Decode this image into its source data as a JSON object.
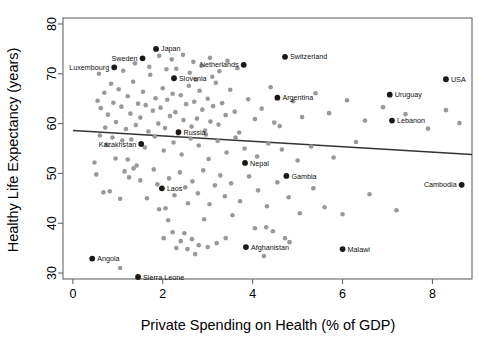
{
  "chart_data": {
    "type": "scatter",
    "title": "",
    "xlabel": "Private Spending on Health (% of GDP)",
    "ylabel": "Healthy Life Expectancy (years)",
    "xlim": [
      -0.22,
      8.88
    ],
    "ylim": [
      28.8,
      81.2
    ],
    "xticks": [
      0,
      2,
      4,
      6,
      8
    ],
    "yticks": [
      30,
      40,
      50,
      60,
      70,
      80
    ],
    "grid": false,
    "legend": null,
    "colors": {
      "highlight_point": "#1a1a1a",
      "other_point": "#999999",
      "trendline": "#333333",
      "axis": "#666666",
      "background": "#ffffff"
    },
    "trendline": {
      "type": "linear",
      "x_start": 0.0,
      "y_start": 58.6,
      "x_end": 8.88,
      "y_end": 53.8
    },
    "labeled_points": [
      {
        "label": "Sweden",
        "x": 1.55,
        "y": 73.1,
        "label_side": "left"
      },
      {
        "label": "Japan",
        "x": 1.85,
        "y": 75.0,
        "label_side": "right"
      },
      {
        "label": "Luxembourg",
        "x": 0.92,
        "y": 71.3,
        "label_side": "left"
      },
      {
        "label": "Slovenia",
        "x": 2.25,
        "y": 69.1,
        "label_side": "right"
      },
      {
        "label": "Netherlands",
        "x": 3.8,
        "y": 71.8,
        "label_side": "left"
      },
      {
        "label": "Switzerland",
        "x": 4.72,
        "y": 73.4,
        "label_side": "right"
      },
      {
        "label": "USA",
        "x": 8.3,
        "y": 68.9,
        "label_side": "right"
      },
      {
        "label": "Uruguay",
        "x": 7.05,
        "y": 65.8,
        "label_side": "right"
      },
      {
        "label": "Argentina",
        "x": 4.55,
        "y": 65.2,
        "label_side": "right"
      },
      {
        "label": "Lebanon",
        "x": 7.1,
        "y": 60.6,
        "label_side": "right"
      },
      {
        "label": "Russia",
        "x": 2.35,
        "y": 58.3,
        "label_side": "right"
      },
      {
        "label": "Kazakhstan",
        "x": 1.52,
        "y": 55.9,
        "label_side": "left"
      },
      {
        "label": "Nepal",
        "x": 3.83,
        "y": 52.1,
        "label_side": "right"
      },
      {
        "label": "Gambia",
        "x": 4.75,
        "y": 49.5,
        "label_side": "right"
      },
      {
        "label": "Cambodia",
        "x": 8.65,
        "y": 47.7,
        "label_side": "left"
      },
      {
        "label": "Laos",
        "x": 1.98,
        "y": 47.0,
        "label_side": "right"
      },
      {
        "label": "Afghanistan",
        "x": 3.85,
        "y": 35.2,
        "label_side": "right"
      },
      {
        "label": "Malawi",
        "x": 6.0,
        "y": 34.8,
        "label_side": "right"
      },
      {
        "label": "Angola",
        "x": 0.43,
        "y": 32.9,
        "label_side": "right"
      },
      {
        "label": "Sierra Leone",
        "x": 1.45,
        "y": 29.2,
        "label_side": "right"
      }
    ],
    "other_points": [
      {
        "x": 0.55,
        "y": 64.6
      },
      {
        "x": 0.62,
        "y": 63.1
      },
      {
        "x": 0.7,
        "y": 66.2
      },
      {
        "x": 0.78,
        "y": 61.8
      },
      {
        "x": 0.85,
        "y": 68.0
      },
      {
        "x": 0.9,
        "y": 64.2
      },
      {
        "x": 0.96,
        "y": 60.3
      },
      {
        "x": 1.02,
        "y": 66.9
      },
      {
        "x": 1.08,
        "y": 63.4
      },
      {
        "x": 1.12,
        "y": 70.6
      },
      {
        "x": 1.18,
        "y": 58.9
      },
      {
        "x": 1.22,
        "y": 65.5
      },
      {
        "x": 1.28,
        "y": 62.0
      },
      {
        "x": 1.34,
        "y": 68.4
      },
      {
        "x": 1.4,
        "y": 59.7
      },
      {
        "x": 1.45,
        "y": 64.0
      },
      {
        "x": 1.5,
        "y": 61.2
      },
      {
        "x": 1.56,
        "y": 66.4
      },
      {
        "x": 1.62,
        "y": 63.7
      },
      {
        "x": 1.68,
        "y": 58.4
      },
      {
        "x": 1.72,
        "y": 69.8
      },
      {
        "x": 1.78,
        "y": 62.6
      },
      {
        "x": 1.84,
        "y": 65.1
      },
      {
        "x": 1.9,
        "y": 60.0
      },
      {
        "x": 1.95,
        "y": 63.2
      },
      {
        "x": 2.0,
        "y": 67.1
      },
      {
        "x": 2.05,
        "y": 59.1
      },
      {
        "x": 2.1,
        "y": 64.8
      },
      {
        "x": 2.16,
        "y": 61.5
      },
      {
        "x": 2.22,
        "y": 66.0
      },
      {
        "x": 2.28,
        "y": 62.3
      },
      {
        "x": 2.34,
        "y": 58.0
      },
      {
        "x": 2.4,
        "y": 65.7
      },
      {
        "x": 2.46,
        "y": 60.7
      },
      {
        "x": 2.52,
        "y": 63.9
      },
      {
        "x": 2.58,
        "y": 67.6
      },
      {
        "x": 2.64,
        "y": 59.4
      },
      {
        "x": 2.7,
        "y": 64.4
      },
      {
        "x": 2.76,
        "y": 61.0
      },
      {
        "x": 2.82,
        "y": 66.6
      },
      {
        "x": 2.88,
        "y": 62.8
      },
      {
        "x": 2.94,
        "y": 58.6
      },
      {
        "x": 3.0,
        "y": 65.0
      },
      {
        "x": 3.06,
        "y": 60.4
      },
      {
        "x": 3.12,
        "y": 63.5
      },
      {
        "x": 3.18,
        "y": 68.2
      },
      {
        "x": 3.24,
        "y": 59.8
      },
      {
        "x": 3.32,
        "y": 64.1
      },
      {
        "x": 3.4,
        "y": 61.7
      },
      {
        "x": 3.5,
        "y": 66.8
      },
      {
        "x": 3.6,
        "y": 62.4
      },
      {
        "x": 3.7,
        "y": 58.2
      },
      {
        "x": 3.9,
        "y": 64.9
      },
      {
        "x": 4.05,
        "y": 60.9
      },
      {
        "x": 4.2,
        "y": 63.0
      },
      {
        "x": 4.4,
        "y": 67.3
      },
      {
        "x": 4.6,
        "y": 59.5
      },
      {
        "x": 4.9,
        "y": 64.5
      },
      {
        "x": 5.1,
        "y": 61.3
      },
      {
        "x": 5.4,
        "y": 66.1
      },
      {
        "x": 5.7,
        "y": 62.1
      },
      {
        "x": 6.1,
        "y": 64.7
      },
      {
        "x": 6.5,
        "y": 60.6
      },
      {
        "x": 6.9,
        "y": 63.3
      },
      {
        "x": 7.4,
        "y": 61.9
      },
      {
        "x": 7.9,
        "y": 59.0
      },
      {
        "x": 8.3,
        "y": 62.7
      },
      {
        "x": 8.6,
        "y": 60.1
      },
      {
        "x": 1.38,
        "y": 72.1
      },
      {
        "x": 1.7,
        "y": 71.4
      },
      {
        "x": 1.92,
        "y": 73.6
      },
      {
        "x": 2.08,
        "y": 70.9
      },
      {
        "x": 2.2,
        "y": 72.9
      },
      {
        "x": 2.3,
        "y": 71.0
      },
      {
        "x": 2.45,
        "y": 73.8
      },
      {
        "x": 2.6,
        "y": 70.2
      },
      {
        "x": 2.68,
        "y": 72.4
      },
      {
        "x": 2.86,
        "y": 71.6
      },
      {
        "x": 3.05,
        "y": 73.2
      },
      {
        "x": 3.26,
        "y": 70.5
      },
      {
        "x": 3.44,
        "y": 72.6
      },
      {
        "x": 3.66,
        "y": 71.1
      },
      {
        "x": 2.74,
        "y": 68.8
      },
      {
        "x": 3.1,
        "y": 69.4
      },
      {
        "x": 1.3,
        "y": 56.8
      },
      {
        "x": 1.6,
        "y": 55.2
      },
      {
        "x": 1.82,
        "y": 57.4
      },
      {
        "x": 2.02,
        "y": 54.6
      },
      {
        "x": 2.24,
        "y": 56.2
      },
      {
        "x": 2.42,
        "y": 53.8
      },
      {
        "x": 2.62,
        "y": 57.0
      },
      {
        "x": 2.8,
        "y": 55.6
      },
      {
        "x": 3.02,
        "y": 52.9
      },
      {
        "x": 3.22,
        "y": 56.5
      },
      {
        "x": 3.42,
        "y": 54.2
      },
      {
        "x": 3.62,
        "y": 57.2
      },
      {
        "x": 3.82,
        "y": 55.0
      },
      {
        "x": 4.1,
        "y": 53.4
      },
      {
        "x": 4.35,
        "y": 56.0
      },
      {
        "x": 4.65,
        "y": 54.8
      },
      {
        "x": 5.0,
        "y": 52.6
      },
      {
        "x": 5.3,
        "y": 55.4
      },
      {
        "x": 5.8,
        "y": 53.2
      },
      {
        "x": 6.3,
        "y": 56.3
      },
      {
        "x": 0.6,
        "y": 57.6
      },
      {
        "x": 0.75,
        "y": 55.8
      },
      {
        "x": 0.95,
        "y": 53.0
      },
      {
        "x": 1.1,
        "y": 56.6
      },
      {
        "x": 0.52,
        "y": 49.8
      },
      {
        "x": 0.68,
        "y": 46.2
      },
      {
        "x": 0.82,
        "y": 46.4
      },
      {
        "x": 1.05,
        "y": 44.9
      },
      {
        "x": 1.15,
        "y": 50.4
      },
      {
        "x": 1.25,
        "y": 49.2
      },
      {
        "x": 1.35,
        "y": 51.0
      },
      {
        "x": 1.5,
        "y": 48.6
      },
      {
        "x": 1.65,
        "y": 45.0
      },
      {
        "x": 1.8,
        "y": 50.8
      },
      {
        "x": 1.88,
        "y": 47.8
      },
      {
        "x": 2.06,
        "y": 43.0
      },
      {
        "x": 2.14,
        "y": 49.0
      },
      {
        "x": 2.26,
        "y": 45.6
      },
      {
        "x": 2.38,
        "y": 50.2
      },
      {
        "x": 2.5,
        "y": 47.2
      },
      {
        "x": 2.56,
        "y": 44.0
      },
      {
        "x": 2.66,
        "y": 48.4
      },
      {
        "x": 2.78,
        "y": 46.0
      },
      {
        "x": 2.9,
        "y": 50.6
      },
      {
        "x": 3.04,
        "y": 43.8
      },
      {
        "x": 3.16,
        "y": 47.6
      },
      {
        "x": 3.28,
        "y": 49.6
      },
      {
        "x": 3.38,
        "y": 45.4
      },
      {
        "x": 3.52,
        "y": 48.0
      },
      {
        "x": 3.72,
        "y": 44.4
      },
      {
        "x": 3.92,
        "y": 49.4
      },
      {
        "x": 4.12,
        "y": 46.6
      },
      {
        "x": 4.32,
        "y": 43.4
      },
      {
        "x": 4.55,
        "y": 48.2
      },
      {
        "x": 4.8,
        "y": 45.2
      },
      {
        "x": 5.05,
        "y": 42.0
      },
      {
        "x": 5.35,
        "y": 47.0
      },
      {
        "x": 5.6,
        "y": 43.2
      },
      {
        "x": 6.0,
        "y": 41.8
      },
      {
        "x": 6.6,
        "y": 45.8
      },
      {
        "x": 7.2,
        "y": 42.6
      },
      {
        "x": 2.02,
        "y": 37.0
      },
      {
        "x": 2.12,
        "y": 40.6
      },
      {
        "x": 2.22,
        "y": 38.2
      },
      {
        "x": 2.3,
        "y": 35.0
      },
      {
        "x": 2.4,
        "y": 36.4
      },
      {
        "x": 2.48,
        "y": 38.0
      },
      {
        "x": 2.55,
        "y": 34.8
      },
      {
        "x": 2.65,
        "y": 36.8
      },
      {
        "x": 2.72,
        "y": 33.8
      },
      {
        "x": 2.8,
        "y": 35.6
      },
      {
        "x": 2.92,
        "y": 40.8
      },
      {
        "x": 3.0,
        "y": 35.2
      },
      {
        "x": 3.2,
        "y": 36.0
      },
      {
        "x": 3.4,
        "y": 37.0
      },
      {
        "x": 4.05,
        "y": 39.0
      },
      {
        "x": 4.3,
        "y": 39.2
      },
      {
        "x": 4.45,
        "y": 38.4
      },
      {
        "x": 4.72,
        "y": 37.0
      },
      {
        "x": 4.82,
        "y": 36.2
      },
      {
        "x": 3.55,
        "y": 41.6
      },
      {
        "x": 1.92,
        "y": 42.8
      },
      {
        "x": 1.05,
        "y": 31.0
      },
      {
        "x": 4.25,
        "y": 33.4
      },
      {
        "x": 0.48,
        "y": 52.2
      },
      {
        "x": 0.72,
        "y": 59.2
      },
      {
        "x": 1.22,
        "y": 52.8
      },
      {
        "x": 1.42,
        "y": 51.6
      },
      {
        "x": 0.58,
        "y": 70.0
      },
      {
        "x": 0.88,
        "y": 57.2
      },
      {
        "x": 2.96,
        "y": 57.8
      },
      {
        "x": 4.48,
        "y": 60.2
      }
    ]
  }
}
